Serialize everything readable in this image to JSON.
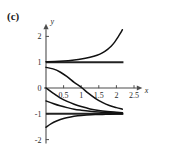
{
  "figure": {
    "panel_label": "(c)",
    "axis_x_name": "x",
    "axis_y_name": "y"
  },
  "chart_data": {
    "type": "line",
    "title": "",
    "subtitle": "",
    "xlabel": "x",
    "ylabel": "y",
    "panel": "(c)",
    "grid": false,
    "legend": null,
    "xlim": [
      -0.12,
      2.75
    ],
    "ylim": [
      -2.15,
      2.35
    ],
    "xticks": [
      0.5,
      1,
      1.5,
      2,
      2.5
    ],
    "xtick_labels": [
      "0.5",
      "1",
      "1.5",
      "2",
      "2.5"
    ],
    "yticks": [
      2,
      1,
      0,
      -1,
      -2
    ],
    "ytick_labels": [
      "2",
      "1",
      "0",
      "-1",
      "-2"
    ],
    "axis_origin": [
      0,
      0
    ],
    "asymptotes": [
      {
        "name": "upper-asymptote",
        "y": 1,
        "x_from": 0,
        "x_to": 2.2
      },
      {
        "name": "lower-asymptote",
        "y": -1,
        "x_from": 0,
        "x_to": 2.2
      }
    ],
    "series": [
      {
        "name": "curve-upper-divergent",
        "comment": "rises from just above y=1 and increases steeply past y=2",
        "x": [
          0.0,
          0.25,
          0.5,
          0.75,
          1.0,
          1.25,
          1.45,
          1.6,
          1.75,
          1.85,
          1.95,
          2.05,
          2.12,
          2.17
        ],
        "y": [
          1.02,
          1.03,
          1.05,
          1.08,
          1.12,
          1.19,
          1.27,
          1.36,
          1.5,
          1.62,
          1.78,
          1.98,
          2.14,
          2.26
        ]
      },
      {
        "name": "curve-crossing-zero",
        "comment": "starts near y=0.8, decreases through zero near x=1.1, tends to -1",
        "x": [
          0.0,
          0.2,
          0.4,
          0.6,
          0.8,
          1.0,
          1.2,
          1.4,
          1.6,
          1.8,
          2.0,
          2.17
        ],
        "y": [
          0.8,
          0.74,
          0.62,
          0.44,
          0.22,
          0.03,
          -0.2,
          -0.4,
          -0.56,
          -0.68,
          -0.76,
          -0.82
        ]
      },
      {
        "name": "curve-from-origin",
        "comment": "starts at the origin (0,0) and decays to the asymptote y=-1",
        "x": [
          0.0,
          0.2,
          0.4,
          0.6,
          0.8,
          1.0,
          1.25,
          1.5,
          1.75,
          2.0,
          2.17
        ],
        "y": [
          0.0,
          -0.2,
          -0.38,
          -0.52,
          -0.63,
          -0.72,
          -0.81,
          -0.87,
          -0.91,
          -0.94,
          -0.96
        ]
      },
      {
        "name": "curve-from-neg-half",
        "comment": "starts near y=-0.5 and approaches y=-1 from above",
        "x": [
          0.0,
          0.2,
          0.4,
          0.6,
          0.8,
          1.0,
          1.25,
          1.5,
          1.75,
          2.0,
          2.17
        ],
        "y": [
          -0.5,
          -0.6,
          -0.69,
          -0.76,
          -0.82,
          -0.86,
          -0.9,
          -0.93,
          -0.95,
          -0.97,
          -0.98
        ]
      },
      {
        "name": "curve-from-below",
        "comment": "starts near y=-1.5 and rises to the asymptote y=-1 from below",
        "x": [
          0.0,
          0.15,
          0.3,
          0.5,
          0.7,
          0.9,
          1.15,
          1.4,
          1.7,
          2.0,
          2.17
        ],
        "y": [
          -1.52,
          -1.38,
          -1.28,
          -1.18,
          -1.12,
          -1.08,
          -1.05,
          -1.03,
          -1.02,
          -1.01,
          -1.01
        ]
      }
    ]
  }
}
